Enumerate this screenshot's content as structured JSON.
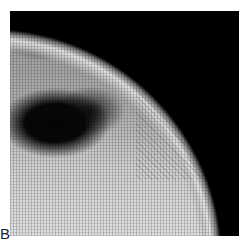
{
  "figure": {
    "panel_label": "B",
    "colors": {
      "background": "#ffffff",
      "dark_region": "#050505",
      "tissue": "#b0b0b0"
    }
  }
}
